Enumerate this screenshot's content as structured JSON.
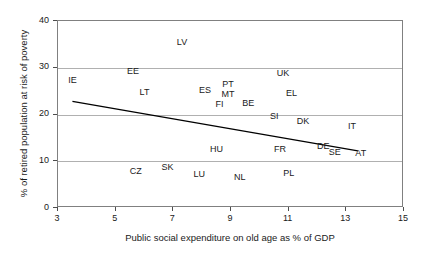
{
  "chart_data": {
    "type": "scatter",
    "title": "",
    "xlabel": "Public social expenditure on old age as % of GDP",
    "ylabel": "% of retired population at risk of poverty",
    "xlim": [
      3,
      15
    ],
    "ylim": [
      0,
      40
    ],
    "xticks": [
      3,
      5,
      7,
      9,
      11,
      13,
      15
    ],
    "yticks": [
      0,
      10,
      20,
      30,
      40
    ],
    "grid": "horizontal",
    "legend": "none",
    "marker_style": "text-label-only",
    "points": [
      {
        "label": "LV",
        "x": 7.3,
        "y": 35.6
      },
      {
        "label": "EE",
        "x": 5.6,
        "y": 29.3
      },
      {
        "label": "UK",
        "x": 10.8,
        "y": 28.9
      },
      {
        "label": "IE",
        "x": 3.5,
        "y": 27.4
      },
      {
        "label": "PT",
        "x": 8.9,
        "y": 26.5
      },
      {
        "label": "ES",
        "x": 8.1,
        "y": 25.2
      },
      {
        "label": "LT",
        "x": 6.0,
        "y": 24.8
      },
      {
        "label": "EL",
        "x": 11.1,
        "y": 24.6
      },
      {
        "label": "MT",
        "x": 8.9,
        "y": 24.4
      },
      {
        "label": "BE",
        "x": 9.6,
        "y": 22.4
      },
      {
        "label": "FI",
        "x": 8.6,
        "y": 22.2
      },
      {
        "label": "SI",
        "x": 10.5,
        "y": 19.7
      },
      {
        "label": "DK",
        "x": 11.5,
        "y": 18.6
      },
      {
        "label": "IT",
        "x": 13.2,
        "y": 17.5
      },
      {
        "label": "DE",
        "x": 12.2,
        "y": 13.3
      },
      {
        "label": "HU",
        "x": 8.5,
        "y": 12.6
      },
      {
        "label": "FR",
        "x": 10.7,
        "y": 12.6
      },
      {
        "label": "SE",
        "x": 12.6,
        "y": 12.0
      },
      {
        "label": "AT",
        "x": 13.5,
        "y": 11.8
      },
      {
        "label": "SK",
        "x": 6.8,
        "y": 8.8
      },
      {
        "label": "CZ",
        "x": 5.7,
        "y": 7.9
      },
      {
        "label": "PL",
        "x": 11.0,
        "y": 7.5
      },
      {
        "label": "LU",
        "x": 7.9,
        "y": 7.3
      },
      {
        "label": "NL",
        "x": 9.3,
        "y": 6.6
      }
    ],
    "trendline": {
      "type": "linear",
      "x0": 3.5,
      "y0": 22.8,
      "x1": 13.4,
      "y1": 12.2,
      "color": "#000000"
    },
    "colors": {
      "gridline": "#b0b0b0",
      "frame": "#808080",
      "text": "#1a1a1a",
      "trendline": "#000000",
      "background": "#ffffff"
    }
  }
}
